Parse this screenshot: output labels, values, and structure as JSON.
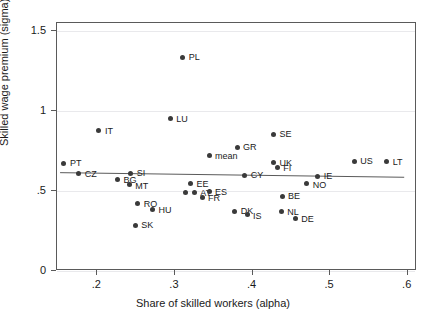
{
  "chart_data": {
    "type": "scatter",
    "title": "",
    "xlabel": "Share of skilled workers (alpha)",
    "ylabel": "Skilled wage premium (sigma)",
    "xlim": [
      0.148,
      0.612
    ],
    "ylim": [
      0.0,
      1.55
    ],
    "xticks": [
      0.2,
      0.3,
      0.4,
      0.5,
      0.6
    ],
    "xtick_labels": [
      ".2",
      ".3",
      ".4",
      ".5",
      ".6"
    ],
    "yticks": [
      0,
      0.5,
      1,
      1.5
    ],
    "ytick_labels": [
      "0",
      ".5",
      "1",
      "1.5"
    ],
    "grid": true,
    "legend": "none",
    "marker_color": "#3a3a3a",
    "fit_line_color": "#5a5a5a",
    "fit_line": {
      "x_start": 0.152,
      "y_start": 0.607,
      "x_end": 0.598,
      "y_end": 0.578
    },
    "points": [
      {
        "label": "PL",
        "x": 0.31,
        "y": 1.335,
        "label_dx": 6,
        "label_dy": 0
      },
      {
        "label": "LU",
        "x": 0.294,
        "y": 0.952,
        "label_dx": 6,
        "label_dy": 0
      },
      {
        "label": "IT",
        "x": 0.202,
        "y": 0.876,
        "label_dx": 6,
        "label_dy": 0
      },
      {
        "label": "SE",
        "x": 0.427,
        "y": 0.855,
        "label_dx": 6,
        "label_dy": 0
      },
      {
        "label": "GR",
        "x": 0.38,
        "y": 0.772,
        "label_dx": 6,
        "label_dy": 0
      },
      {
        "label": "mean",
        "x": 0.344,
        "y": 0.725,
        "label_dx": 6,
        "label_dy": 1
      },
      {
        "label": "PT",
        "x": 0.157,
        "y": 0.675,
        "label_dx": 6,
        "label_dy": 0
      },
      {
        "label": "US",
        "x": 0.531,
        "y": 0.685,
        "label_dx": 6,
        "label_dy": 0
      },
      {
        "label": "LT",
        "x": 0.573,
        "y": 0.684,
        "label_dx": 6,
        "label_dy": 0
      },
      {
        "label": "UK",
        "x": 0.427,
        "y": 0.676,
        "label_dx": 6,
        "label_dy": 0
      },
      {
        "label": "FI",
        "x": 0.432,
        "y": 0.648,
        "label_dx": 6,
        "label_dy": 1
      },
      {
        "label": "SI",
        "x": 0.243,
        "y": 0.611,
        "label_dx": 6,
        "label_dy": 0
      },
      {
        "label": "CZ",
        "x": 0.176,
        "y": 0.611,
        "label_dx": 6,
        "label_dy": 1
      },
      {
        "label": "CY",
        "x": 0.39,
        "y": 0.597,
        "label_dx": 6,
        "label_dy": 0
      },
      {
        "label": "IE",
        "x": 0.484,
        "y": 0.593,
        "label_dx": 6,
        "label_dy": 0
      },
      {
        "label": "BG",
        "x": 0.226,
        "y": 0.572,
        "label_dx": 6,
        "label_dy": 1
      },
      {
        "label": "NO",
        "x": 0.47,
        "y": 0.545,
        "label_dx": 6,
        "label_dy": 1
      },
      {
        "label": "EE",
        "x": 0.32,
        "y": 0.546,
        "label_dx": 6,
        "label_dy": 0
      },
      {
        "label": "MT",
        "x": 0.241,
        "y": 0.54,
        "label_dx": 6,
        "label_dy": 1
      },
      {
        "label": "AT",
        "x": 0.325,
        "y": 0.492,
        "label_dx": 6,
        "label_dy": 1
      },
      {
        "label": "ES",
        "x": 0.344,
        "y": 0.495,
        "label_dx": 6,
        "label_dy": 0
      },
      {
        "label": "",
        "x": 0.314,
        "y": 0.492,
        "label_dx": 0,
        "label_dy": 0
      },
      {
        "label": "FR",
        "x": 0.335,
        "y": 0.462,
        "label_dx": 6,
        "label_dy": 1
      },
      {
        "label": "BE",
        "x": 0.438,
        "y": 0.466,
        "label_dx": 6,
        "label_dy": 0
      },
      {
        "label": "RO",
        "x": 0.252,
        "y": 0.421,
        "label_dx": 6,
        "label_dy": 0
      },
      {
        "label": "HU",
        "x": 0.271,
        "y": 0.385,
        "label_dx": 6,
        "label_dy": 1
      },
      {
        "label": "DK",
        "x": 0.377,
        "y": 0.372,
        "label_dx": 6,
        "label_dy": 0
      },
      {
        "label": "IS",
        "x": 0.393,
        "y": 0.353,
        "label_dx": 6,
        "label_dy": 1
      },
      {
        "label": "NL",
        "x": 0.437,
        "y": 0.369,
        "label_dx": 6,
        "label_dy": 0
      },
      {
        "label": "DE",
        "x": 0.455,
        "y": 0.33,
        "label_dx": 6,
        "label_dy": 1
      },
      {
        "label": "SK",
        "x": 0.249,
        "y": 0.285,
        "label_dx": 6,
        "label_dy": 0
      }
    ]
  }
}
